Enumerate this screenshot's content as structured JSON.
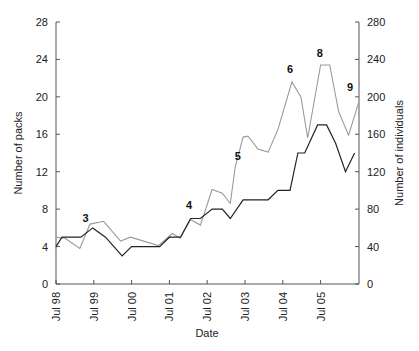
{
  "chart_data": {
    "type": "line",
    "title": "",
    "xlabel": "Date",
    "ylabel": "Number of packs",
    "y2label": "Number of individuals",
    "ylim": [
      0,
      28
    ],
    "y2lim": [
      0,
      280
    ],
    "yticks": [
      0,
      4,
      8,
      12,
      16,
      20,
      24,
      28
    ],
    "y2ticks": [
      0,
      40,
      80,
      120,
      160,
      200,
      240,
      280
    ],
    "xticks": [
      {
        "t": 1998.5,
        "label": "Jul 98"
      },
      {
        "t": 1999.5,
        "label": "Jul 99"
      },
      {
        "t": 2000.5,
        "label": "Jul 00"
      },
      {
        "t": 2001.5,
        "label": "Jul 01"
      },
      {
        "t": 2002.5,
        "label": "Jul 02"
      },
      {
        "t": 2003.5,
        "label": "Jul 03"
      },
      {
        "t": 2004.5,
        "label": "Jul 04"
      },
      {
        "t": 2005.5,
        "label": "Jul 05"
      }
    ],
    "grid": false,
    "legend": null,
    "series": [
      {
        "name": "Number of packs",
        "axis": "left",
        "color": "#222222",
        "points": [
          [
            1998.5,
            4
          ],
          [
            1998.66,
            5
          ],
          [
            1999.16,
            5
          ],
          [
            1999.47,
            6
          ],
          [
            1999.81,
            5
          ],
          [
            2000.25,
            3
          ],
          [
            2000.5,
            4
          ],
          [
            2001.24,
            4
          ],
          [
            2001.5,
            5
          ],
          [
            2001.79,
            5
          ],
          [
            2002.06,
            7
          ],
          [
            2002.32,
            7
          ],
          [
            2002.63,
            8
          ],
          [
            2002.9,
            8
          ],
          [
            2003.11,
            7
          ],
          [
            2003.45,
            9
          ],
          [
            2004.11,
            9
          ],
          [
            2004.37,
            10
          ],
          [
            2004.69,
            10
          ],
          [
            2004.9,
            14
          ],
          [
            2005.08,
            14
          ],
          [
            2005.42,
            17
          ],
          [
            2005.66,
            17
          ],
          [
            2005.9,
            15
          ],
          [
            2006.16,
            12
          ],
          [
            2006.4,
            14
          ]
        ]
      },
      {
        "name": "Number of individuals",
        "axis": "right",
        "color": "#9a9a9a",
        "points": [
          [
            1998.5,
            50
          ],
          [
            1998.74,
            49
          ],
          [
            1999.13,
            38
          ],
          [
            1999.4,
            64
          ],
          [
            1999.76,
            67
          ],
          [
            2000.21,
            46
          ],
          [
            2000.47,
            50
          ],
          [
            2001.21,
            41
          ],
          [
            2001.58,
            54
          ],
          [
            2001.79,
            49
          ],
          [
            2002.06,
            69
          ],
          [
            2002.32,
            63
          ],
          [
            2002.63,
            101
          ],
          [
            2002.9,
            97
          ],
          [
            2003.11,
            86
          ],
          [
            2003.24,
            125
          ],
          [
            2003.45,
            157
          ],
          [
            2003.58,
            158
          ],
          [
            2003.85,
            144
          ],
          [
            2004.11,
            141
          ],
          [
            2004.37,
            165
          ],
          [
            2004.74,
            216
          ],
          [
            2004.98,
            200
          ],
          [
            2005.16,
            156
          ],
          [
            2005.5,
            234
          ],
          [
            2005.74,
            234
          ],
          [
            2005.98,
            184
          ],
          [
            2006.24,
            159
          ],
          [
            2006.5,
            193
          ]
        ]
      }
    ],
    "annotations": [
      {
        "text": "3",
        "t": 1999.28,
        "y_pack": 6.6
      },
      {
        "text": "4",
        "t": 2002.02,
        "y_pack": 8.0
      },
      {
        "text": "5",
        "t": 2003.31,
        "y_pack": 13.3
      },
      {
        "text": "6",
        "t": 2004.69,
        "y_pack": 22.6
      },
      {
        "text": "8",
        "t": 2005.48,
        "y_pack": 24.3
      },
      {
        "text": "9",
        "t": 2006.28,
        "y_pack": 20.6
      }
    ]
  },
  "layout": {
    "plot_left": 56,
    "plot_right": 359,
    "plot_top": 22,
    "plot_bottom": 284,
    "x_t0": 1998.5,
    "px_per_year": 37.8
  }
}
